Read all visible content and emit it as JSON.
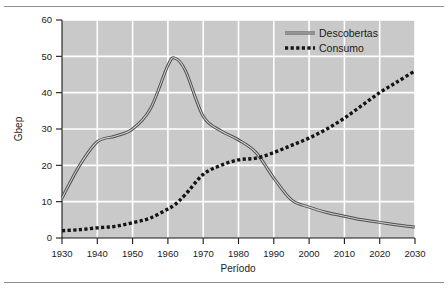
{
  "figure": {
    "name": "oil-discoveries-vs-consumption-chart",
    "background": "#ffffff",
    "plot_background": "#c9c9c9",
    "grid_color": "#ffffff",
    "axis_color": "#1a1a1a"
  },
  "chart_data": {
    "type": "line",
    "title": "",
    "xlabel": "Período",
    "ylabel": "Gbep",
    "xlim": [
      1930,
      2030
    ],
    "ylim": [
      0,
      60
    ],
    "xticks": [
      1930,
      1940,
      1950,
      1960,
      1970,
      1980,
      1990,
      2000,
      2010,
      2020,
      2030
    ],
    "xtick_labels": [
      "1930",
      "1940",
      "1950",
      "1960",
      "1970",
      "1980",
      "1990",
      "2000",
      "2010",
      "2020",
      "2030"
    ],
    "yticks": [
      0,
      10,
      20,
      30,
      40,
      50,
      60
    ],
    "ytick_labels": [
      "0",
      "10",
      "20",
      "30",
      "40",
      "50",
      "60"
    ],
    "grid": true,
    "grid_axis": "both",
    "legend_position": "top-right",
    "x": [
      1930,
      1935,
      1940,
      1945,
      1950,
      1955,
      1960,
      1962,
      1965,
      1970,
      1975,
      1980,
      1985,
      1990,
      1995,
      2000,
      2005,
      2010,
      2015,
      2020,
      2025,
      2030
    ],
    "series": [
      {
        "name": "Descobertas",
        "style": "solid",
        "color": "#4d4d4d",
        "values": [
          11,
          20,
          26.5,
          28,
          30,
          35.5,
          47.5,
          49.5,
          46,
          33.5,
          29.5,
          27,
          23.5,
          16.5,
          10.5,
          8.5,
          7,
          6,
          5,
          4.3,
          3.6,
          3
        ]
      },
      {
        "name": "Consumo",
        "style": "dashed",
        "color": "#141414",
        "values": [
          2,
          2.3,
          2.8,
          3.2,
          4.2,
          5.5,
          8,
          9.2,
          12,
          17.5,
          20,
          21.5,
          22,
          23.5,
          25.5,
          27.5,
          30,
          33,
          36.5,
          40,
          43,
          46
        ]
      }
    ],
    "annotations": []
  },
  "legend": {
    "items": [
      {
        "label": "Descobertas",
        "style": "solid"
      },
      {
        "label": "Consumo",
        "style": "dashed"
      }
    ]
  }
}
